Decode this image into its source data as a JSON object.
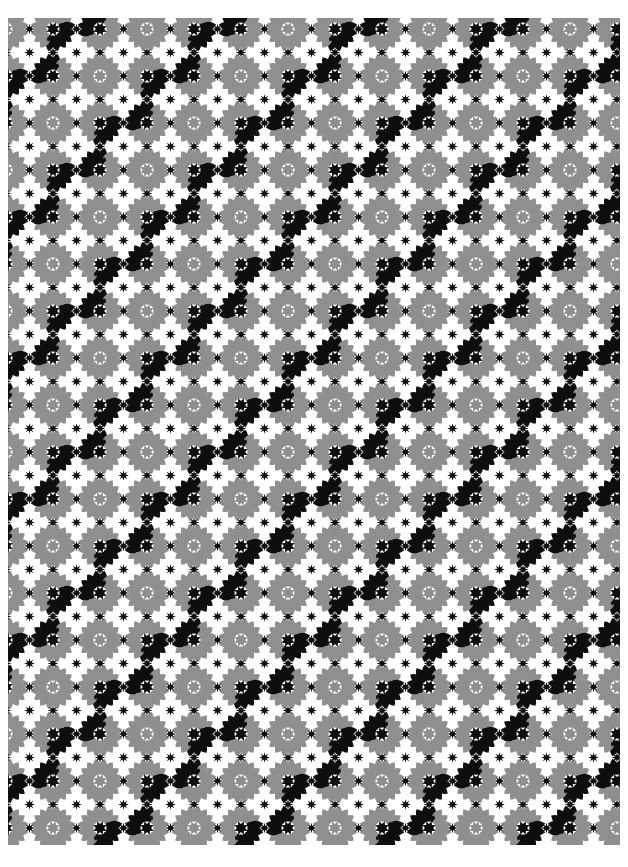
{
  "page": {
    "kind": "decorative-pattern-image",
    "background_color": "#ffffff"
  },
  "pattern": {
    "canvas": {
      "width": 628,
      "height": 867
    },
    "margins": {
      "left": 8,
      "top": 18,
      "right": 8,
      "bottom": 22
    },
    "colors": {
      "background": "#ffffff",
      "black": "#0e0e0e",
      "gray": "#8f8f8f"
    },
    "lattice": {
      "x0": 6,
      "y0": 29,
      "dx": 47,
      "dy": 47,
      "gray_rosette_rule_modulo": 3
    },
    "rosette": {
      "outer_petal_count": 16,
      "outer_petal_angle_offset_deg": 11.25,
      "outer_r_base": 12,
      "outer_r_tip": 22.6,
      "outer_half_width": 4.4,
      "inner_petal_count": 16,
      "inner_petal_angle_offset_deg": 0,
      "inner_r_base": 7.8,
      "inner_r_tip": 13.4,
      "inner_half_width": 2.3,
      "center_star_points": 8,
      "center_star_R": 7.2,
      "center_star_r": 4.1,
      "center_star_rot_deg": 22.5
    },
    "interstitial_star": {
      "points": 8,
      "R": 5.3,
      "r": 2.3,
      "rot_deg": 0
    },
    "gray_distance_threshold": 41
  }
}
